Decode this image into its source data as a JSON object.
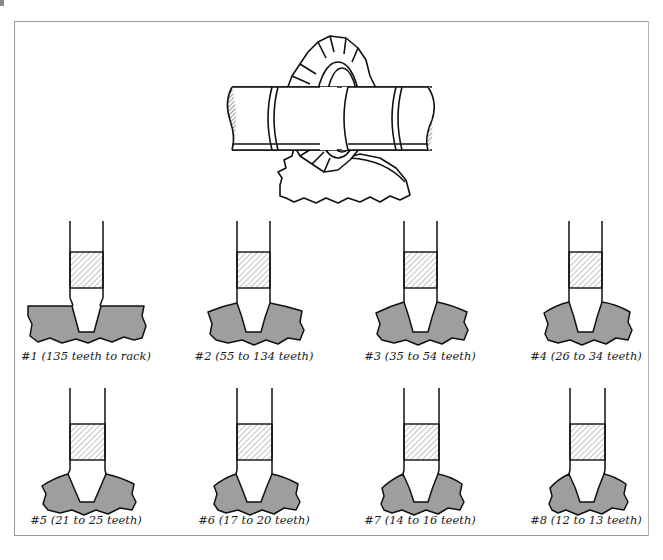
{
  "figure": {
    "title_illustration": "gear-cutter-on-arbor-cutting-gear",
    "colors": {
      "frame_border": "#9a9a9a",
      "line": "#111111",
      "gear_fill": "#9e9e9e",
      "hatch": "#555555",
      "background": "#ffffff"
    },
    "cutters": [
      {
        "number": "#1",
        "label": "#1 (135 teeth to rack)",
        "range": "135 teeth to rack",
        "curvature": 0
      },
      {
        "number": "#2",
        "label": "#2 (55 to 134 teeth)",
        "range": "55 to 134 teeth",
        "curvature": 1
      },
      {
        "number": "#3",
        "label": "#3 (35 to 54 teeth)",
        "range": "35 to 54 teeth",
        "curvature": 2
      },
      {
        "number": "#4",
        "label": "#4 (26 to 34 teeth)",
        "range": "26 to 34 teeth",
        "curvature": 3
      },
      {
        "number": "#5",
        "label": "#5 (21 to 25 teeth)",
        "range": "21 to 25 teeth",
        "curvature": 4
      },
      {
        "number": "#6",
        "label": "#6 (17 to 20 teeth)",
        "range": "17 to 20 teeth",
        "curvature": 5
      },
      {
        "number": "#7",
        "label": "#7 (14 to 16 teeth)",
        "range": "14 to 16 teeth",
        "curvature": 6
      },
      {
        "number": "#8",
        "label": "#8 (12 to 13 teeth)",
        "range": "12 to 13 teeth",
        "curvature": 7
      }
    ]
  }
}
